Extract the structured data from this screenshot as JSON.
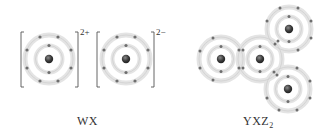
{
  "compounds": [
    {
      "formula": "WX",
      "label_prefix": "WX",
      "label_sub": "",
      "type": "ionic",
      "ions": [
        {
          "symbol": "W",
          "charge": "2+",
          "center": [
            49,
            59
          ],
          "inner_electrons": 2,
          "outer_electrons": 8
        },
        {
          "symbol": "X",
          "charge": "2−",
          "center": [
            126,
            59
          ],
          "inner_electrons": 2,
          "outer_electrons": 8
        }
      ]
    },
    {
      "formula": "YXZ2",
      "label_prefix": "YXZ",
      "label_sub": "2",
      "type": "covalent",
      "atoms": [
        {
          "symbol": "Y",
          "center": [
            221,
            59
          ]
        },
        {
          "symbol": "X",
          "center": [
            260,
            59
          ]
        },
        {
          "symbol": "Z",
          "center": [
            289,
            29
          ]
        },
        {
          "symbol": "Z",
          "center": [
            288,
            89
          ]
        }
      ]
    }
  ],
  "colors": {
    "electron": "#6e6e6e",
    "nucleus": "#3a3a3a",
    "ring": "#d6d6d6",
    "bracket": "#555555",
    "text": "#333333"
  }
}
